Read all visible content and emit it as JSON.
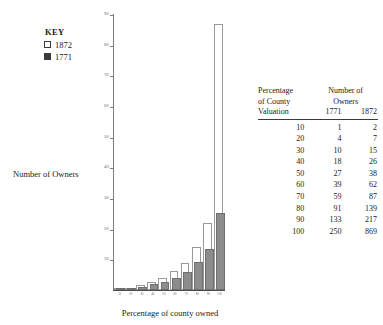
{
  "legend": {
    "title": "KEY",
    "entries": [
      {
        "label": "1872",
        "style": "open",
        "color": "#ffffff"
      },
      {
        "label": "1771",
        "style": "solid",
        "color": "#3a3a3a"
      }
    ]
  },
  "axes": {
    "ylabel": "Number of Owners",
    "xlabel": "Percentage of county owned"
  },
  "table": {
    "header": {
      "col0_line1": "Percentage",
      "col0_line2": "of County",
      "col0_line3": "Valuation",
      "span_line1": "Number of",
      "span_line2": "Owners",
      "col1": "1771",
      "col2": "1872"
    },
    "rows": [
      {
        "pct": "10",
        "y1771": "1",
        "y1872": "2"
      },
      {
        "pct": "20",
        "y1771": "4",
        "y1872": "7"
      },
      {
        "pct": "30",
        "y1771": "10",
        "y1872": "15"
      },
      {
        "pct": "40",
        "y1771": "18",
        "y1872": "26"
      },
      {
        "pct": "50",
        "y1771": "27",
        "y1872": "38"
      },
      {
        "pct": "60",
        "y1771": "39",
        "y1872": "62"
      },
      {
        "pct": "70",
        "y1771": "59",
        "y1872": "87"
      },
      {
        "pct": "80",
        "y1771": "91",
        "y1872": "139"
      },
      {
        "pct": "90",
        "y1771": "133",
        "y1872": "217"
      },
      {
        "pct": "100",
        "y1771": "250",
        "y1872": "869"
      }
    ]
  },
  "chart_data": {
    "type": "bar",
    "title": "",
    "xlabel": "Percentage of county owned",
    "ylabel": "Number of Owners",
    "categories": [
      "10",
      "20",
      "30",
      "40",
      "50",
      "60",
      "70",
      "80",
      "90",
      "100"
    ],
    "series": [
      {
        "name": "1872",
        "values": [
          2,
          7,
          15,
          26,
          38,
          62,
          87,
          139,
          217,
          869
        ],
        "color": "#ffffff"
      },
      {
        "name": "1771",
        "values": [
          1,
          4,
          10,
          18,
          27,
          39,
          59,
          91,
          133,
          250
        ],
        "color": "#8c8c8c"
      }
    ],
    "ylim": [
      0,
      900
    ],
    "yticks": [
      100,
      200,
      300,
      400,
      500,
      600,
      700,
      800,
      900
    ],
    "ytick_labels": [
      "100",
      "200",
      "300",
      "400",
      "500",
      "600",
      "700",
      "800",
      "900"
    ],
    "grid": false,
    "legend_position": "upper-left"
  }
}
